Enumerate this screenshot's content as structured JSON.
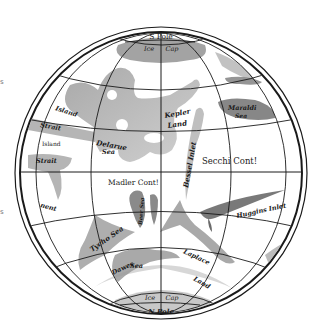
{
  "map": {
    "title": "Map of Mars",
    "colors": {
      "background": "#ffffff",
      "ink": "#1a1a1a",
      "sea_dark": "#6e6e6e",
      "sea_light": "#b5b5b5"
    },
    "poles": {
      "top": "S Pole",
      "bottom": "N Pole"
    },
    "ice_caps": {
      "top_left": "Ice",
      "top_right": "Cap",
      "bottom_left": "Ice",
      "bottom_right": "Cap"
    },
    "labels": {
      "island_upper": "Island",
      "strait_upper": "Strait",
      "island_mid": "Island",
      "strait_lower": "Strait",
      "nent": "nent",
      "delarue_sea_1": "Delarue",
      "delarue_sea_2": "Sea",
      "kepler_land_1": "Kepler",
      "kepler_land_2": "Land",
      "maraldi_sea_1": "Maraldi",
      "maraldi_sea_2": "Sea",
      "bessel_inlet": "Bessel Inlet",
      "secchi_cont": "Secchi Cont!",
      "madler_cont": "Madler Cont!",
      "huggins_inlet": "Huggins Inlet",
      "dawes_sea": "Tycho Sea",
      "dawes_ocean_1": "Dawes",
      "dawes_ocean_2": "Sea",
      "laplace_land_1": "Laplace",
      "laplace_land_2": "Land",
      "beer_sea": "Beer Sea"
    },
    "edge_marks": {
      "upper": "s",
      "lower": "s"
    }
  }
}
